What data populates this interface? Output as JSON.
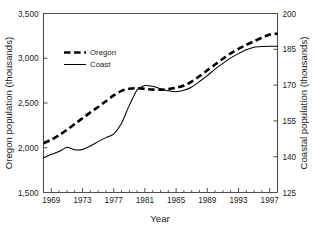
{
  "chart_data": {
    "type": "line",
    "title": "",
    "subtitle": "",
    "xlabel": "Year",
    "ylabel": "Oregon population (thousands)",
    "y2label": "Coastal population (thousands)",
    "xlim": [
      1968,
      1998
    ],
    "ylim": [
      1500,
      3500
    ],
    "y2lim": [
      125,
      200
    ],
    "grid": false,
    "legend_position": "upper-left-inside",
    "xticks": [
      1969,
      1973,
      1977,
      1981,
      1985,
      1989,
      1993,
      1997
    ],
    "xticklabels": [
      "1969",
      "1973",
      "1977",
      "1981",
      "1985",
      "1989",
      "1993",
      "1997"
    ],
    "xminorticks": [
      1968,
      1970,
      1971,
      1972,
      1974,
      1975,
      1976,
      1978,
      1979,
      1980,
      1982,
      1983,
      1984,
      1986,
      1987,
      1988,
      1990,
      1991,
      1992,
      1994,
      1995,
      1996,
      1998
    ],
    "yticks": [
      1500,
      2000,
      2500,
      3000,
      3500
    ],
    "yticklabels": [
      "1,500",
      "2,000",
      "2,500",
      "3,000",
      "3,500"
    ],
    "y2ticks": [
      125,
      140,
      155,
      170,
      185,
      200
    ],
    "y2ticklabels": [
      "125",
      "140",
      "155",
      "170",
      "185",
      "200"
    ],
    "x": [
      1968,
      1969,
      1970,
      1971,
      1972,
      1973,
      1974,
      1975,
      1976,
      1977,
      1978,
      1979,
      1980,
      1981,
      1982,
      1983,
      1984,
      1985,
      1986,
      1987,
      1988,
      1989,
      1990,
      1991,
      1992,
      1993,
      1994,
      1995,
      1996,
      1997,
      1998
    ],
    "series": [
      {
        "name": "Oregon",
        "axis": "left",
        "style": "dashed",
        "color": "#000000",
        "units": "thousands",
        "values": [
          2050,
          2090,
          2140,
          2200,
          2265,
          2330,
          2395,
          2455,
          2520,
          2585,
          2635,
          2660,
          2665,
          2658,
          2650,
          2648,
          2655,
          2670,
          2695,
          2740,
          2800,
          2865,
          2930,
          2995,
          3055,
          3105,
          3150,
          3190,
          3230,
          3265,
          3275
        ]
      },
      {
        "name": "Coast",
        "axis": "right",
        "style": "solid",
        "color": "#000000",
        "units": "thousands",
        "values": [
          139.5,
          141.0,
          142.2,
          144.0,
          142.9,
          143.0,
          144.5,
          146.3,
          148.0,
          149.5,
          154.0,
          161.5,
          168.0,
          169.8,
          169.5,
          168.5,
          167.6,
          167.2,
          167.8,
          169.2,
          171.5,
          174.0,
          176.7,
          179.1,
          181.4,
          183.2,
          184.8,
          185.9,
          186.2,
          186.3,
          186.3
        ]
      }
    ]
  },
  "legend": {
    "entries": [
      {
        "label": "Oregon",
        "style": "dashed"
      },
      {
        "label": "Coast",
        "style": "solid"
      }
    ]
  },
  "axes": {
    "left_title": "Oregon population (thousands)",
    "right_title": "Coastal population (thousands)",
    "bottom_title": "Year"
  },
  "colors": {
    "line": "#000000",
    "axis": "#4f4f4f",
    "text": "#1a1a1a",
    "background": "#ffffff"
  }
}
